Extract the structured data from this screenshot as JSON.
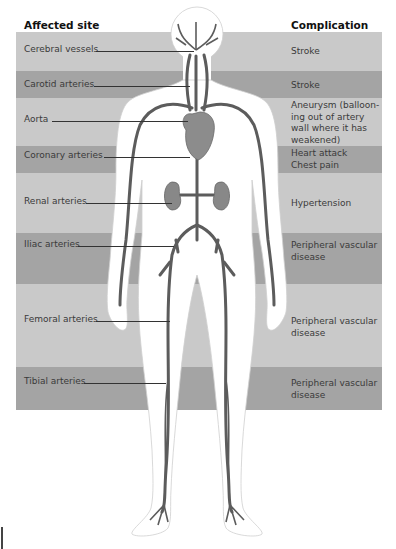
{
  "headers": {
    "site": "Affected site",
    "complication": "Complication"
  },
  "colors": {
    "band_light": "#c9c9c9",
    "band_dark": "#a4a4a4",
    "artery": "#5a5a5a",
    "organ": "#8a8a8a",
    "body": "#ffffff"
  },
  "rows": [
    {
      "site": "Cerebral vessels",
      "complication": "Stroke",
      "shade": "light"
    },
    {
      "site": "Carotid arteries",
      "complication": "Stroke",
      "shade": "dark"
    },
    {
      "site": "Aorta",
      "complication": "Aneurysm (ballooning out of artery wall where it has weakened)",
      "complication_lines": [
        "Aneurysm (balloon-",
        "ing out of artery",
        "wall where it has",
        "weakened)"
      ],
      "shade": "light"
    },
    {
      "site": "Coronary arteries",
      "complication": "Heart attack / Chest pain",
      "complication_lines": [
        "Heart attack",
        "Chest pain"
      ],
      "shade": "dark"
    },
    {
      "site": "Renal arteries",
      "complication": "Hypertension",
      "shade": "light"
    },
    {
      "site": "Iliac arteries",
      "complication": "Peripheral vascular disease",
      "complication_lines": [
        "Peripheral vascular",
        "disease"
      ],
      "shade": "dark"
    },
    {
      "site": "Femoral arteries",
      "complication": "Peripheral vascular disease",
      "complication_lines": [
        "Peripheral vascular",
        "disease"
      ],
      "shade": "light"
    },
    {
      "site": "Tibial arteries",
      "complication": "Peripheral vascular disease",
      "complication_lines": [
        "Peripheral vascular",
        "disease"
      ],
      "shade": "dark"
    }
  ]
}
